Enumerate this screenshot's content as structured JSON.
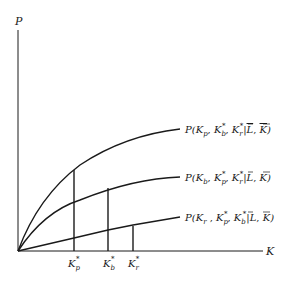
{
  "diagram": {
    "type": "economic production curves",
    "axes": {
      "y_label": "P",
      "x_label": "K"
    },
    "curves": [
      {
        "id": "kp",
        "label": {
          "P": "P(",
          "var": "K",
          "var_sub": "p",
          "sep1": ", ",
          "a": "K",
          "a_sub": "b",
          "a_sup": "*",
          "sep2": ", ",
          "b": "K",
          "b_sub": "r",
          "b_sup": "*",
          "bar": "|",
          "L": "L",
          "comma": ", ",
          "Kbar": "K",
          "close": ")"
        }
      },
      {
        "id": "kb",
        "label": {
          "P": "P(",
          "var": "K",
          "var_sub": "b",
          "sep1": ", ",
          "a": "K",
          "a_sub": "p",
          "a_sup": "*",
          "sep2": ", ",
          "b": "K",
          "b_sub": "r",
          "b_sup": "*",
          "bar": "|",
          "L": "L",
          "comma": ", ",
          "Kbar": "K",
          "close": ")"
        }
      },
      {
        "id": "kr",
        "label": {
          "P": "P(",
          "var": "K",
          "var_sub": "r",
          "sep1": " , ",
          "a": "K",
          "a_sub": "p",
          "a_sup": "*",
          "sep2": ", ",
          "b": "K",
          "b_sub": "b",
          "b_sup": "*",
          "bar": "|",
          "L": "L",
          "comma": ", ",
          "Kbar": "K",
          "close": ")"
        }
      }
    ],
    "ticks": [
      {
        "main": "K",
        "sub": "p",
        "sup": "*"
      },
      {
        "main": "K",
        "sub": "b",
        "sup": "*"
      },
      {
        "main": "K",
        "sub": "r",
        "sup": "*"
      }
    ]
  }
}
